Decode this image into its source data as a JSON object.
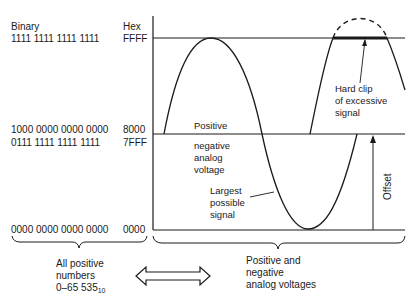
{
  "header": {
    "binary_label": "Binary",
    "hex_label": "Hex"
  },
  "codes": [
    {
      "binary": "1111 1111 1111 1111",
      "hex": "FFFF"
    },
    {
      "binary": "1000 0000 0000 0000",
      "hex": "8000"
    },
    {
      "binary": "0111 1111 1111 1111",
      "hex": "7FFF"
    },
    {
      "binary": "0000 0000 0000 0000",
      "hex": "0000"
    }
  ],
  "annotations": {
    "hard_clip": [
      "Hard clip",
      "of excessive",
      "signal"
    ],
    "positive": "Positive",
    "negative": [
      "negative",
      "analog",
      "voltage"
    ],
    "largest": [
      "Largest",
      "possible",
      "signal"
    ],
    "offset": "Offset"
  },
  "footer": {
    "left": [
      "All positive",
      "numbers",
      "0–65 535"
    ],
    "left_subscript": "10",
    "right": [
      "Positive and",
      "negative",
      "analog voltages"
    ]
  },
  "colors": {
    "line": "#1a1a1a",
    "background": "#ffffff"
  }
}
